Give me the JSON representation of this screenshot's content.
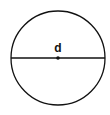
{
  "diagram": {
    "label": "d",
    "colors": {
      "stroke": "#111111",
      "background": "#ffffff"
    },
    "shape": {
      "cx": 58,
      "cy": 58,
      "r": 47
    }
  }
}
